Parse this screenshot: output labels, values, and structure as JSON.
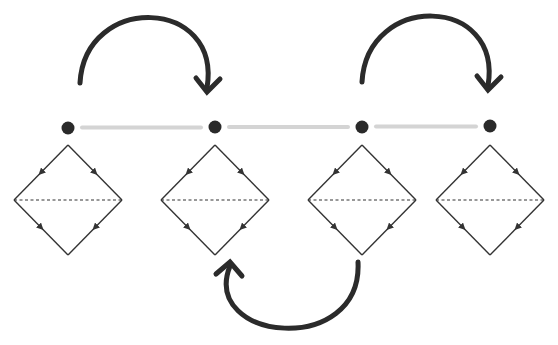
{
  "diagram": {
    "colors": {
      "background": "#ffffff",
      "node": "#2a2a2a",
      "connector": "#d4d4d4",
      "diamond_stroke": "#333333",
      "curved_arrow": "#2b2b2b"
    },
    "nodes": [
      {
        "id": 1,
        "cx": 68,
        "cy": 128
      },
      {
        "id": 2,
        "cx": 215,
        "cy": 127
      },
      {
        "id": 3,
        "cx": 362,
        "cy": 127
      },
      {
        "id": 4,
        "cx": 490,
        "cy": 126
      }
    ],
    "connectors": [
      {
        "from": 1,
        "to": 2
      },
      {
        "from": 2,
        "to": 3
      },
      {
        "from": 3,
        "to": 4
      }
    ],
    "diamonds": [
      {
        "node": 1,
        "cx": 68,
        "top": 145,
        "mid": 200,
        "bottom": 255,
        "half_width": 54
      },
      {
        "node": 2,
        "cx": 215,
        "top": 145,
        "mid": 200,
        "bottom": 255,
        "half_width": 54
      },
      {
        "node": 3,
        "cx": 362,
        "top": 145,
        "mid": 200,
        "bottom": 255,
        "half_width": 54
      },
      {
        "node": 4,
        "cx": 490,
        "top": 145,
        "mid": 200,
        "bottom": 255,
        "half_width": 54
      }
    ],
    "curved_arrows": [
      {
        "from": 1,
        "to": 2,
        "position": "above",
        "start": [
          80,
          83
        ],
        "end": [
          207,
          92
        ]
      },
      {
        "from": 3,
        "to": 4,
        "position": "above",
        "start": [
          362,
          82
        ],
        "end": [
          488,
          90
        ]
      },
      {
        "from": 3,
        "to": 2,
        "position": "below",
        "start": [
          358,
          262
        ],
        "end": [
          230,
          262
        ]
      }
    ]
  }
}
